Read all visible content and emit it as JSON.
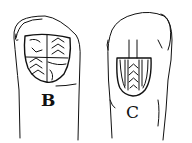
{
  "illustration": {
    "description": "Line drawing of two objects (fingers/seal stones) each bearing an engraved heraldic shield",
    "items": [
      {
        "id": "B",
        "label": "B",
        "shield": "quartered shield with chevrons"
      },
      {
        "id": "C",
        "label": "C",
        "shield": "shield with vertical bands and chevrons"
      }
    ],
    "colors": {
      "ink": "#111111",
      "background": "#ffffff"
    }
  }
}
